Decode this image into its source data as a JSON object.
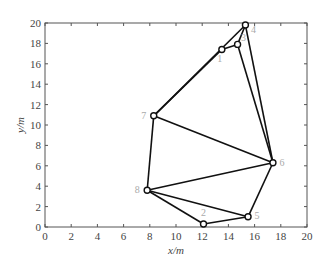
{
  "chart_data": {
    "type": "scatter",
    "title": "",
    "xlabel": "x/m",
    "ylabel": "y/m",
    "xlim": [
      0,
      20
    ],
    "ylim": [
      0,
      20
    ],
    "xticks": [
      "0",
      "2",
      "4",
      "6",
      "8",
      "10",
      "12",
      "14",
      "16",
      "18",
      "20"
    ],
    "yticks": [
      "0",
      "2",
      "4",
      "6",
      "8",
      "10",
      "12",
      "14",
      "16",
      "18",
      "20"
    ],
    "grid": false,
    "nodes": [
      {
        "id": "1",
        "x": 13.5,
        "y": 17.4
      },
      {
        "id": "2",
        "x": 12.1,
        "y": 0.3
      },
      {
        "id": "3",
        "x": 14.7,
        "y": 17.9
      },
      {
        "id": "4",
        "x": 15.3,
        "y": 19.8
      },
      {
        "id": "5",
        "x": 15.5,
        "y": 1.0
      },
      {
        "id": "6",
        "x": 17.4,
        "y": 6.3
      },
      {
        "id": "7",
        "x": 8.3,
        "y": 10.9
      },
      {
        "id": "8",
        "x": 7.8,
        "y": 3.6
      }
    ],
    "edges": [
      [
        "7",
        "1"
      ],
      [
        "1",
        "3"
      ],
      [
        "3",
        "4"
      ],
      [
        "7",
        "4"
      ],
      [
        "4",
        "6"
      ],
      [
        "3",
        "6"
      ],
      [
        "7",
        "6"
      ],
      [
        "7",
        "8"
      ],
      [
        "8",
        "6"
      ],
      [
        "8",
        "2"
      ],
      [
        "8",
        "5"
      ],
      [
        "2",
        "5"
      ],
      [
        "5",
        "6"
      ]
    ]
  }
}
